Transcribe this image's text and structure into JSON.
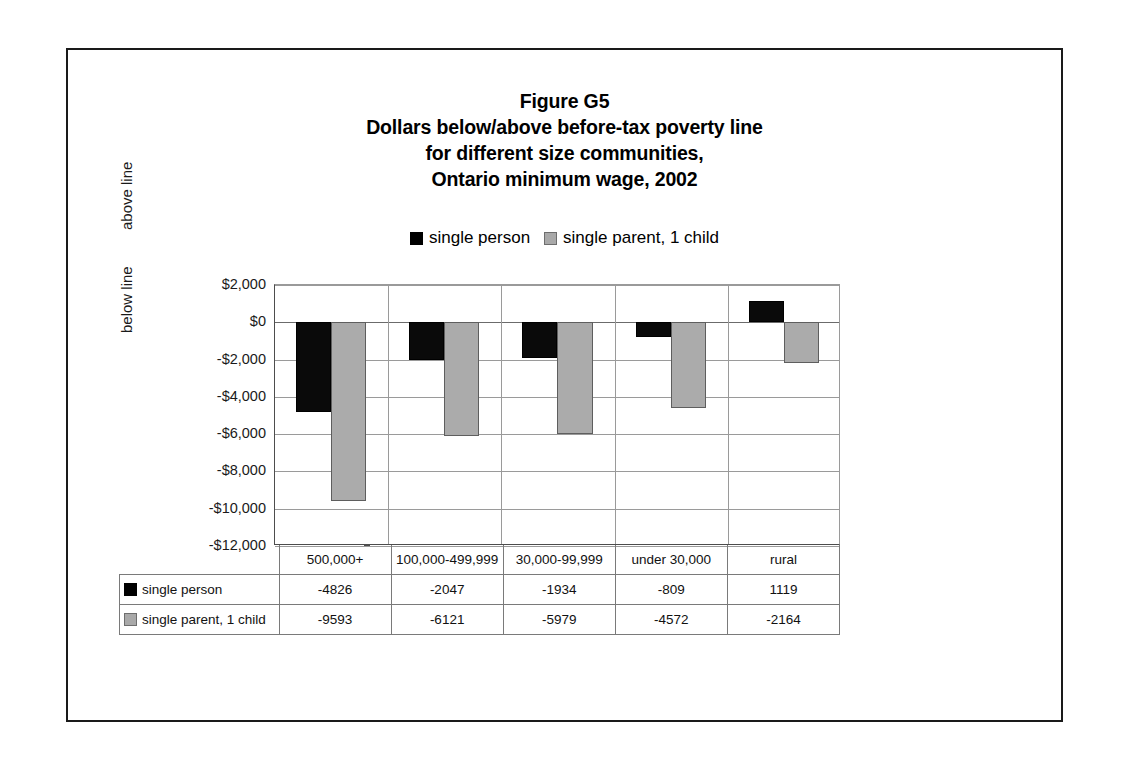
{
  "figure": {
    "title_lines": [
      "Figure G5",
      "Dollars below/above before-tax poverty line",
      "for different size communities,",
      "Ontario minimum wage, 2002"
    ]
  },
  "legend": {
    "entries": [
      {
        "label": "single person",
        "swatch": "black-square-icon",
        "color": "#000000"
      },
      {
        "label": "single parent, 1 child",
        "swatch": "gray-square-icon",
        "color": "#a9a9a9"
      }
    ]
  },
  "axis": {
    "y_ticks": [
      "$2,000",
      "$0",
      "-$2,000",
      "-$4,000",
      "-$6,000",
      "-$8,000",
      "-$10,000",
      "-$12,000"
    ],
    "annotations": {
      "above": "above line",
      "below": "below line"
    }
  },
  "table": {
    "corner": "",
    "categories": [
      "500,000+",
      "100,000-499,999",
      "30,000-99,999",
      "under 30,000",
      "rural"
    ],
    "rows": [
      {
        "label": "single person",
        "swatch": "black-square-icon",
        "values": [
          "-4826",
          "-2047",
          "-1934",
          "-809",
          "1119"
        ]
      },
      {
        "label": "single parent, 1 child",
        "swatch": "gray-square-icon",
        "values": [
          "-9593",
          "-6121",
          "-5979",
          "-4572",
          "-2164"
        ]
      }
    ]
  },
  "chart_data": {
    "type": "bar",
    "xlabel": "",
    "ylabel": "",
    "categories": [
      "500,000+",
      "100,000-499,999",
      "30,000-99,999",
      "under 30,000",
      "rural"
    ],
    "series": [
      {
        "name": "single person",
        "color": "#000000",
        "values": [
          -4826,
          -2047,
          -1934,
          -809,
          1119
        ]
      },
      {
        "name": "single parent, 1 child",
        "color": "#a9a9a9",
        "values": [
          -9593,
          -6121,
          -5979,
          -4572,
          -2164
        ]
      }
    ],
    "ylim": [
      -12000,
      2000
    ],
    "ytick_step": 2000,
    "ytick_values": [
      2000,
      0,
      -2000,
      -4000,
      -6000,
      -8000,
      -10000,
      -12000
    ],
    "ytick_labels": [
      "$2,000",
      "$0",
      "-$2,000",
      "-$4,000",
      "-$6,000",
      "-$8,000",
      "-$10,000",
      "-$12,000"
    ],
    "grid": true,
    "legend_position": "top",
    "annotations": [
      "above line",
      "below line"
    ]
  }
}
